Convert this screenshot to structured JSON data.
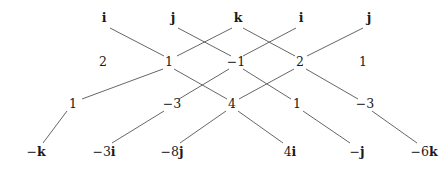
{
  "diagram": {
    "kind": "lattice-multiplication-trellis",
    "width": 448,
    "height": 170,
    "background_color": "#ffffff",
    "line_color": "#555555",
    "text_color": "#1a1a1a",
    "rows": [
      {
        "name": "top-units-row",
        "y": 18,
        "nodes": [
          {
            "id": "t0",
            "label": "i",
            "x": 104,
            "style": "unit"
          },
          {
            "id": "t1",
            "label": "j",
            "x": 173,
            "style": "unit"
          },
          {
            "id": "t2",
            "label": "k",
            "x": 238,
            "style": "unit"
          },
          {
            "id": "t3",
            "label": "i",
            "x": 301,
            "style": "unit"
          },
          {
            "id": "t4",
            "label": "j",
            "x": 369,
            "style": "unit"
          }
        ]
      },
      {
        "name": "upper-coefficient-row",
        "y": 62,
        "nodes": [
          {
            "id": "u0",
            "label": "2",
            "x": 103,
            "style": "coef"
          },
          {
            "id": "u1",
            "label": "1",
            "x": 169,
            "style": "coef"
          },
          {
            "id": "u2",
            "label": "−1",
            "x": 236,
            "style": "coef"
          },
          {
            "id": "u3",
            "label": "2",
            "x": 300,
            "style": "coef"
          },
          {
            "id": "u4",
            "label": "1",
            "x": 363,
            "style": "coef"
          }
        ]
      },
      {
        "name": "lower-coefficient-row",
        "y": 104,
        "nodes": [
          {
            "id": "l0",
            "label": "1",
            "x": 73,
            "style": "coef"
          },
          {
            "id": "l1",
            "label": "−3",
            "x": 172,
            "style": "coef"
          },
          {
            "id": "l2",
            "label": "4",
            "x": 232,
            "style": "coef"
          },
          {
            "id": "l3",
            "label": "1",
            "x": 297,
            "style": "coef"
          },
          {
            "id": "l4",
            "label": "−3",
            "x": 365,
            "style": "coef"
          }
        ]
      },
      {
        "name": "bottom-terms-row",
        "y": 152,
        "nodes": [
          {
            "id": "b0",
            "coefficient": "−",
            "unit": "k",
            "label": "−k",
            "x": 36,
            "style": "term"
          },
          {
            "id": "b1",
            "coefficient": "−3",
            "unit": "i",
            "label": "−3i",
            "x": 104,
            "style": "term"
          },
          {
            "id": "b2",
            "coefficient": "−8",
            "unit": "j",
            "label": "−8j",
            "x": 172,
            "style": "term"
          },
          {
            "id": "b3",
            "coefficient": "4",
            "unit": "i",
            "label": "4i",
            "x": 290,
            "style": "term"
          },
          {
            "id": "b4",
            "coefficient": "−",
            "unit": "j",
            "label": "−j",
            "x": 357,
            "style": "term"
          },
          {
            "id": "b5",
            "coefficient": "−6",
            "unit": "k",
            "label": "−6k",
            "x": 424,
            "style": "term"
          }
        ]
      }
    ],
    "edges": [
      {
        "name": "edge-i1-to-1",
        "from": "t0",
        "to": "u1",
        "x1": 110,
        "y1": 28,
        "x2": 164,
        "y2": 56
      },
      {
        "name": "edge-j1-to-neg1",
        "from": "t1",
        "to": "u2",
        "x1": 178,
        "y1": 28,
        "x2": 231,
        "y2": 56
      },
      {
        "name": "edge-k-to-1",
        "from": "t2",
        "to": "u1",
        "x1": 232,
        "y1": 28,
        "x2": 177,
        "y2": 56
      },
      {
        "name": "edge-k-to-2",
        "from": "t2",
        "to": "u3",
        "x1": 243,
        "y1": 28,
        "x2": 295,
        "y2": 56
      },
      {
        "name": "edge-i2-to-neg1",
        "from": "t3",
        "to": "u2",
        "x1": 296,
        "y1": 28,
        "x2": 243,
        "y2": 56
      },
      {
        "name": "edge-j2-to-2",
        "from": "t4",
        "to": "u3",
        "x1": 363,
        "y1": 28,
        "x2": 307,
        "y2": 56
      },
      {
        "name": "edge-1-to-1",
        "from": "u1",
        "to": "l0",
        "x1": 163,
        "y1": 69,
        "x2": 82,
        "y2": 99
      },
      {
        "name": "edge-1-to-4",
        "from": "u1",
        "to": "l2",
        "x1": 174,
        "y1": 69,
        "x2": 227,
        "y2": 99
      },
      {
        "name": "edge-neg1-to-neg3",
        "from": "u2",
        "to": "l1",
        "x1": 229,
        "y1": 69,
        "x2": 179,
        "y2": 99
      },
      {
        "name": "edge-neg1-to-1b",
        "from": "u2",
        "to": "l3",
        "x1": 243,
        "y1": 69,
        "x2": 291,
        "y2": 99
      },
      {
        "name": "edge-2-to-4",
        "from": "u3",
        "to": "l2",
        "x1": 294,
        "y1": 69,
        "x2": 239,
        "y2": 99
      },
      {
        "name": "edge-2-to-neg3",
        "from": "u3",
        "to": "l4",
        "x1": 306,
        "y1": 69,
        "x2": 358,
        "y2": 99
      },
      {
        "name": "edge-1-to-negk",
        "from": "l0",
        "to": "b0",
        "x1": 67,
        "y1": 111,
        "x2": 43,
        "y2": 143
      },
      {
        "name": "edge-neg3-to-neg3i",
        "from": "l1",
        "to": "b1",
        "x1": 164,
        "y1": 111,
        "x2": 112,
        "y2": 143
      },
      {
        "name": "edge-4-to-neg8j",
        "from": "l2",
        "to": "b2",
        "x1": 226,
        "y1": 111,
        "x2": 180,
        "y2": 143
      },
      {
        "name": "edge-4-to-4i",
        "from": "l2",
        "to": "b3",
        "x1": 238,
        "y1": 111,
        "x2": 283,
        "y2": 143
      },
      {
        "name": "edge-1b-to-negj",
        "from": "l3",
        "to": "b4",
        "x1": 303,
        "y1": 111,
        "x2": 350,
        "y2": 143
      },
      {
        "name": "edge-neg3b-to-neg6k",
        "from": "l4",
        "to": "b5",
        "x1": 372,
        "y1": 111,
        "x2": 417,
        "y2": 143
      }
    ]
  }
}
